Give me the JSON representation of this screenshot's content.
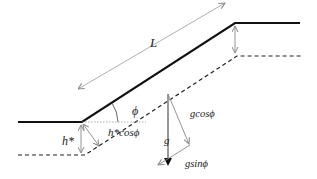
{
  "diagram": {
    "labels": {
      "length": "L",
      "angle": "ϕ",
      "thickness": "h*",
      "normal_thickness": "h*cosϕ",
      "gravity": "g",
      "gravity_normal": "gcosϕ",
      "gravity_tangential": "gsinϕ"
    },
    "colors": {
      "surface_line": "#111111",
      "bed_line": "#222222",
      "arrow": "#888888",
      "gravity_arrow": "#333333"
    },
    "geometry": {
      "surface": [
        [
          18,
          122
        ],
        [
          82,
          122
        ],
        [
          235,
          23
        ],
        [
          300,
          23
        ]
      ],
      "bed": [
        [
          18,
          155
        ],
        [
          85,
          155
        ],
        [
          237,
          56
        ],
        [
          302,
          56
        ]
      ]
    }
  }
}
